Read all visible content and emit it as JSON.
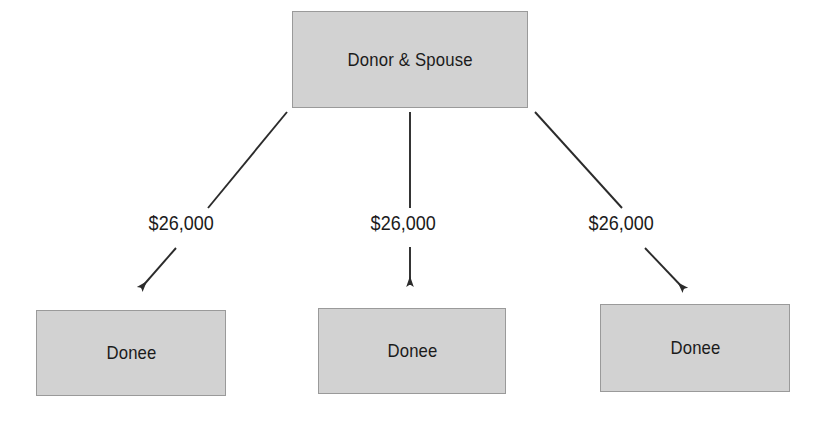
{
  "diagram": {
    "colors": {
      "box_fill": "#d2d2d2",
      "box_border": "#9a9a9a",
      "line": "#2b2b2b",
      "text": "#1b1b1b",
      "background": "#ffffff"
    },
    "root": {
      "label": "Donor & Spouse"
    },
    "edges": [
      {
        "amount": "$26,000",
        "direction": "down-left",
        "arrow_icon": "arrow-down-left-icon"
      },
      {
        "amount": "$26,000",
        "direction": "down",
        "arrow_icon": "arrow-down-icon"
      },
      {
        "amount": "$26,000",
        "direction": "down-right",
        "arrow_icon": "arrow-down-right-icon"
      }
    ],
    "donees": [
      {
        "label": "Donee"
      },
      {
        "label": "Donee"
      },
      {
        "label": "Donee"
      }
    ]
  }
}
